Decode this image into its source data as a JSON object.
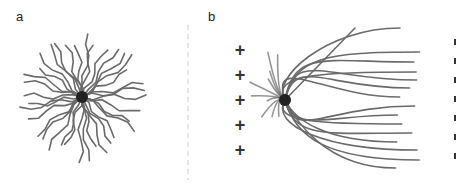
{
  "figure": {
    "panels": [
      {
        "label": "a",
        "description": "radial neuron-like cell with processes extending in all directions"
      },
      {
        "label": "b",
        "description": "cell with processes oriented toward negative electrode"
      }
    ],
    "electrodes": {
      "positive_symbol": "+",
      "positive_count": 5,
      "negative_count": 7
    },
    "colors": {
      "stroke": "#6a6a6a",
      "soma": "#222222",
      "divider": "#cccccc"
    }
  }
}
